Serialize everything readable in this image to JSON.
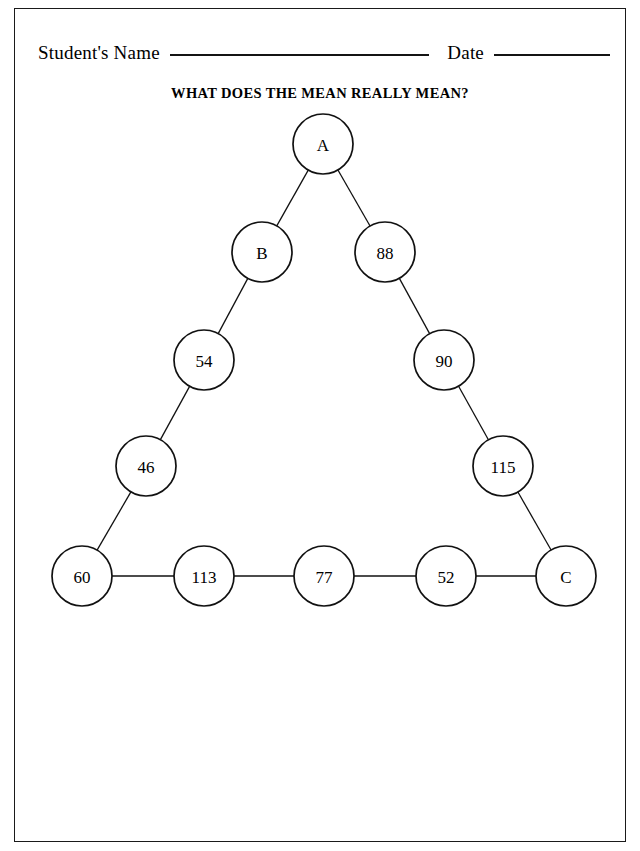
{
  "page": {
    "background_color": "#ffffff",
    "border_color": "#1a1a1a",
    "ink_color": "#111111"
  },
  "header": {
    "student_name_label": "Student's Name",
    "date_label": "Date"
  },
  "title": "WHAT DOES THE MEAN REALLY MEAN?",
  "diagram": {
    "shape": "triangle",
    "nodes": [
      {
        "id": "apex",
        "label": "A",
        "cx": 309,
        "cy": 44,
        "r": 30,
        "is_blank": true
      },
      {
        "id": "left-1",
        "label": "B",
        "cx": 248,
        "cy": 152,
        "r": 30,
        "is_blank": true
      },
      {
        "id": "right-1",
        "label": "88",
        "cx": 371,
        "cy": 152,
        "r": 30,
        "is_blank": false
      },
      {
        "id": "left-2",
        "label": "54",
        "cx": 190,
        "cy": 260,
        "r": 30,
        "is_blank": false
      },
      {
        "id": "right-2",
        "label": "90",
        "cx": 430,
        "cy": 260,
        "r": 30,
        "is_blank": false
      },
      {
        "id": "left-3",
        "label": "46",
        "cx": 132,
        "cy": 366,
        "r": 30,
        "is_blank": false
      },
      {
        "id": "right-3",
        "label": "115",
        "cx": 489,
        "cy": 366,
        "r": 30,
        "is_blank": false
      },
      {
        "id": "bottom-1",
        "label": "60",
        "cx": 68,
        "cy": 476,
        "r": 30,
        "is_blank": false
      },
      {
        "id": "bottom-2",
        "label": "113",
        "cx": 190,
        "cy": 476,
        "r": 30,
        "is_blank": false
      },
      {
        "id": "bottom-3",
        "label": "77",
        "cx": 310,
        "cy": 476,
        "r": 30,
        "is_blank": false
      },
      {
        "id": "bottom-4",
        "label": "52",
        "cx": 432,
        "cy": 476,
        "r": 30,
        "is_blank": false
      },
      {
        "id": "bottom-5",
        "label": "C",
        "cx": 552,
        "cy": 476,
        "r": 30,
        "is_blank": true
      }
    ],
    "edges": [
      [
        "apex",
        "left-1"
      ],
      [
        "apex",
        "right-1"
      ],
      [
        "left-1",
        "left-2"
      ],
      [
        "left-2",
        "left-3"
      ],
      [
        "left-3",
        "bottom-1"
      ],
      [
        "right-1",
        "right-2"
      ],
      [
        "right-2",
        "right-3"
      ],
      [
        "right-3",
        "bottom-5"
      ],
      [
        "bottom-1",
        "bottom-2"
      ],
      [
        "bottom-2",
        "bottom-3"
      ],
      [
        "bottom-3",
        "bottom-4"
      ],
      [
        "bottom-4",
        "bottom-5"
      ]
    ],
    "blank_nodes": [
      "A",
      "B",
      "C"
    ],
    "given_values": [
      88,
      54,
      90,
      46,
      115,
      60,
      113,
      77,
      52
    ]
  }
}
